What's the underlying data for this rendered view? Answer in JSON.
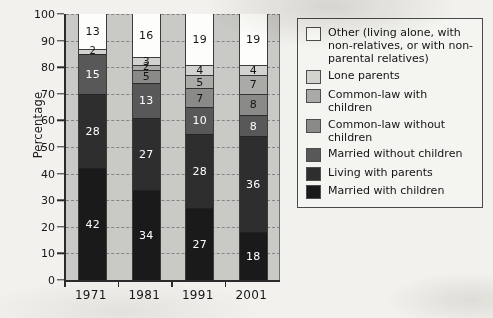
{
  "chart_data": {
    "type": "bar",
    "stacked": true,
    "title": "",
    "xlabel": "",
    "ylabel": "Percentage",
    "ylim": [
      0,
      100
    ],
    "ytick_step": 10,
    "yticks": [
      "0",
      "10",
      "20",
      "30",
      "40",
      "50",
      "60",
      "70",
      "80",
      "90",
      "100"
    ],
    "grid": true,
    "grid_style": "dashed horizontal",
    "legend_position": "right",
    "categories": [
      "1971",
      "1981",
      "1991",
      "2001"
    ],
    "series": [
      {
        "name": "Married with children",
        "color": "#1a1a1a",
        "label_color": "light",
        "values": [
          42,
          34,
          27,
          18
        ]
      },
      {
        "name": "Living with parents",
        "color": "#2e2e2e",
        "label_color": "light",
        "values": [
          28,
          27,
          28,
          36
        ]
      },
      {
        "name": "Married without children",
        "color": "#585858",
        "label_color": "light",
        "values": [
          15,
          13,
          10,
          8
        ]
      },
      {
        "name": "Common-law without children",
        "color": "#8a8a88",
        "label_color": "dark",
        "values": [
          0,
          5,
          7,
          8
        ]
      },
      {
        "name": "Common-law with children",
        "color": "#aaaaa7",
        "label_color": "dark",
        "values": [
          0,
          2,
          5,
          7
        ]
      },
      {
        "name": "Lone parents",
        "color": "#d2d2ce",
        "label_color": "dark",
        "values": [
          2,
          3,
          4,
          4
        ]
      },
      {
        "name": "Other",
        "color": "#fdfdfb",
        "label_color": "dark",
        "values": [
          13,
          16,
          19,
          19
        ]
      }
    ]
  },
  "legend": {
    "entries": [
      {
        "label": "Other (living alone, with non-relatives, or with non-parental relatives)",
        "color": "#fdfdfb"
      },
      {
        "label": "Lone parents",
        "color": "#d2d2ce"
      },
      {
        "label": "Common-law with children",
        "color": "#aaaaa7"
      },
      {
        "label": "Common-law without children",
        "color": "#8a8a88"
      },
      {
        "label": "Married without children",
        "color": "#585858"
      },
      {
        "label": "Living with parents",
        "color": "#2e2e2e"
      },
      {
        "label": "Married with children",
        "color": "#1a1a1a"
      }
    ]
  },
  "axes": {
    "y_title": "Percentage",
    "plot_background": "#c9c9c6"
  }
}
